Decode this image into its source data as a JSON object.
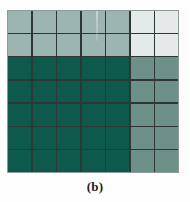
{
  "figure": {
    "caption": "(b)",
    "background_color": "#fefefe"
  },
  "chart_data": {
    "type": "heatmap",
    "title": "",
    "subtitle": "",
    "xlabel": "",
    "ylabel": "",
    "caption": "(b)",
    "rows": 7,
    "cols": 7,
    "grid_on": true,
    "gridline_color": "#2e3636",
    "border_color": "#8e9a99",
    "legend_position": "none",
    "x": [
      1,
      2,
      3,
      4,
      5,
      6,
      7
    ],
    "y": [
      1,
      2,
      3,
      4,
      5,
      6,
      7
    ],
    "xtick_labels": [],
    "ytick_labels": [],
    "value_levels": [
      {
        "name": "very-light",
        "value": 0,
        "color": "#e3eae9"
      },
      {
        "name": "light",
        "value": 1,
        "color": "#9db5b0"
      },
      {
        "name": "medium",
        "value": 2,
        "color": "#6d9189"
      },
      {
        "name": "dark",
        "value": 3,
        "color": "#0d5a4c"
      }
    ],
    "values": [
      [
        1,
        1,
        1,
        1,
        1,
        0,
        0
      ],
      [
        1,
        1,
        1,
        1,
        1,
        0,
        0
      ],
      [
        3,
        3,
        3,
        3,
        3,
        2,
        2
      ],
      [
        3,
        3,
        3,
        3,
        3,
        2,
        2
      ],
      [
        3,
        3,
        3,
        3,
        3,
        2,
        2
      ],
      [
        3,
        3,
        3,
        3,
        3,
        2,
        2
      ],
      [
        3,
        3,
        3,
        3,
        3,
        2,
        2
      ]
    ],
    "colors": [
      [
        "#9db5b0",
        "#9db5b0",
        "#9db5b0",
        "#9db5b0",
        "#9db5b0",
        "#e3eae9",
        "#e3eae9"
      ],
      [
        "#9db5b0",
        "#9db5b0",
        "#9db5b0",
        "#9db5b0",
        "#9db5b0",
        "#e3eae9",
        "#e3eae9"
      ],
      [
        "#0d5a4c",
        "#0d5a4c",
        "#0d5a4c",
        "#0d5a4c",
        "#0d5a4c",
        "#6d9189",
        "#6d9189"
      ],
      [
        "#0d5a4c",
        "#0d5a4c",
        "#0d5a4c",
        "#0d5a4c",
        "#0d5a4c",
        "#6d9189",
        "#6d9189"
      ],
      [
        "#0d5a4c",
        "#0d5a4c",
        "#0d5a4c",
        "#0d5a4c",
        "#0d5a4c",
        "#6d9189",
        "#6d9189"
      ],
      [
        "#0d5a4c",
        "#0d5a4c",
        "#0d5a4c",
        "#0d5a4c",
        "#0d5a4c",
        "#6d9189",
        "#6d9189"
      ],
      [
        "#0d5a4c",
        "#0d5a4c",
        "#0d5a4c",
        "#0d5a4c",
        "#0d5a4c",
        "#6d9189",
        "#6d9189"
      ]
    ]
  }
}
